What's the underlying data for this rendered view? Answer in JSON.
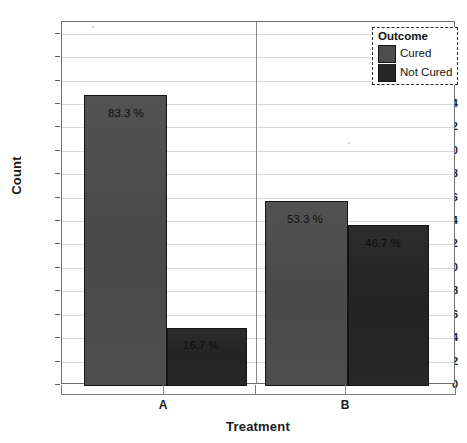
{
  "chart_data": {
    "type": "bar",
    "title": "",
    "subtitle": "",
    "xlabel": "Treatment",
    "ylabel": "Count",
    "categories": [
      "A",
      "B"
    ],
    "grid": true,
    "legend_position": "top-right",
    "ylim": [
      0,
      31
    ],
    "y_ticks": [
      0,
      2,
      4,
      6,
      8,
      10,
      12,
      14,
      16,
      18,
      20,
      22,
      24,
      26,
      28,
      30
    ],
    "legend_title": "Outcome",
    "series": [
      {
        "name": "Cured",
        "color": "#4d4d4d",
        "values": [
          25,
          16
        ],
        "data_labels": [
          "83.3 %",
          "53.3 %"
        ]
      },
      {
        "name": "Not Cured",
        "color": "#272727",
        "values": [
          5,
          14
        ],
        "data_labels": [
          "16.7 %",
          "46.7 %"
        ]
      }
    ],
    "bars": [
      {
        "category": "A",
        "series": "Cured",
        "value": 25,
        "label": "83.3 %"
      },
      {
        "category": "A",
        "series": "Not Cured",
        "value": 5,
        "label": "16.7 %"
      },
      {
        "category": "B",
        "series": "Cured",
        "value": 16,
        "label": "53.3 %"
      },
      {
        "category": "B",
        "series": "Not Cured",
        "value": 14,
        "label": "46.7 %"
      }
    ]
  },
  "axes": {
    "y_title": "Count",
    "x_title": "Treatment",
    "y_tick_labels": [
      "30",
      "28",
      "26",
      "24",
      "22",
      "20",
      "18",
      "16",
      "14",
      "12",
      "10",
      "8",
      "6",
      "4",
      "2",
      "0"
    ],
    "x_tick_labels": [
      "A",
      "B"
    ]
  },
  "legend": {
    "title": "Outcome",
    "items": [
      {
        "label": "Cured",
        "color": "#4d4d4d"
      },
      {
        "label": "Not Cured",
        "color": "#272727"
      }
    ]
  },
  "bar_labels": {
    "a_cured": "83.3 %",
    "a_not_cured": "16.7 %",
    "b_cured": "53.3 %",
    "b_not_cured": "46.7 %"
  },
  "colors": {
    "cured": "#4d4d4d",
    "not_cured": "#272727",
    "grid": "#d8d8d8",
    "frame": "#6e6e6e",
    "text": "#1a1a1a",
    "background": "#ffffff"
  }
}
